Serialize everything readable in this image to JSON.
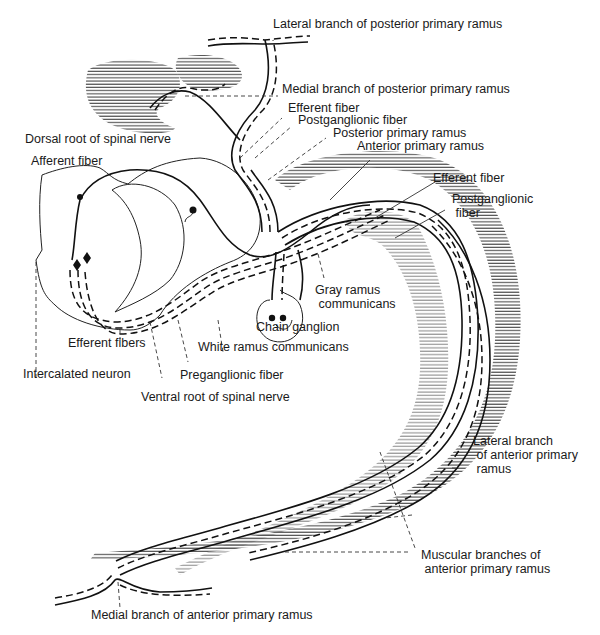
{
  "diagram": {
    "labels": {
      "lateral_branch_posterior": "Lateral branch of posterior primary ramus",
      "medial_branch_posterior": "Medial branch of posterior primary ramus",
      "efferent_fiber_top": "Efferent fiber",
      "postganglionic_fiber_top": "Postganglionic fiber",
      "posterior_primary_ramus": "Posterior primary ramus",
      "anterior_primary_ramus": "Anterior primary ramus",
      "dorsal_root": "Dorsal root of spinal nerve",
      "afferent_fiber": "Afferent fiber",
      "efferent_fiber_right": "Efferent fiber",
      "postganglionic_fiber_right": "Postganglionic\n fiber",
      "gray_ramus": "Gray ramus\n communicans",
      "chain_ganglion": "Chain ganglion",
      "white_ramus": "White ramus communicans",
      "efferent_fibers": "Efferent fibers",
      "intercalated_neuron": "Intercalated neuron",
      "preganglionic_fiber": "Preganglionic fiber",
      "ventral_root": "Ventral root of spinal nerve",
      "lateral_branch_anterior": "Lateral branch\n of anterior primary\n ramus",
      "muscular_branches": "Muscular branches of\n anterior primary ramus",
      "medial_branch_anterior": "Medial branch of anterior primary ramus"
    }
  }
}
